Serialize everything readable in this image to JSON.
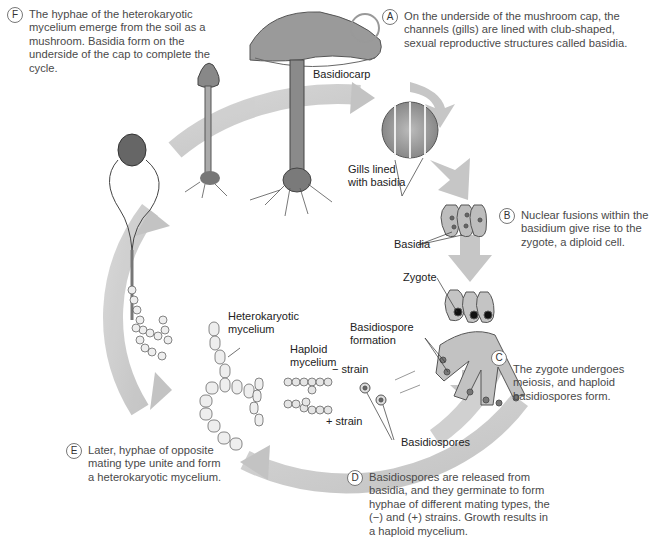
{
  "diagram": {
    "type": "life-cycle",
    "colors": {
      "cycle_arrow": "#c8c8c8",
      "cell_fill": "#e9e9e9",
      "nucleus": "#666666",
      "mushroom": "#8a8a8a",
      "text": "#4a4a4a"
    },
    "steps": [
      {
        "letter": "A",
        "text": "On the underside of the mushroom cap, the channels (gills) are lined with club-shaped, sexual reproductive structures called basidia."
      },
      {
        "letter": "B",
        "text": "Nuclear fusions within the basidium give rise to the zygote, a diploid cell."
      },
      {
        "letter": "C",
        "text": "The zygote undergoes meiosis, and haploid basidiospores form."
      },
      {
        "letter": "D",
        "text": "Basidiospores are released from basidia, and they germinate to form hyphae of different mating types, the (−) and (+) strains. Growth results in a haploid mycelium."
      },
      {
        "letter": "E",
        "text": "Later, hyphae of opposite mating type unite and form a heterokaryotic mycelium."
      },
      {
        "letter": "F",
        "text": "The hyphae of the heterokaryotic mycelium emerge from the soil as a mushroom. Basidia form on the underside of the cap to complete the cycle."
      }
    ],
    "labels": {
      "basidiocarp": "Basidiocarp",
      "gills_1": "Gills lined",
      "gills_2": "with basidia",
      "basidia": "Basidia",
      "zygote": "Zygote",
      "basidiospore_formation_1": "Basidiospore",
      "basidiospore_formation_2": "formation",
      "basidiospores": "Basidiospores",
      "heterokaryotic_1": "Heterokaryotic",
      "heterokaryotic_2": "mycelium",
      "haploid_1": "Haploid",
      "haploid_2": "mycelium",
      "minus_strain": "− strain",
      "plus_strain": "+ strain"
    }
  }
}
